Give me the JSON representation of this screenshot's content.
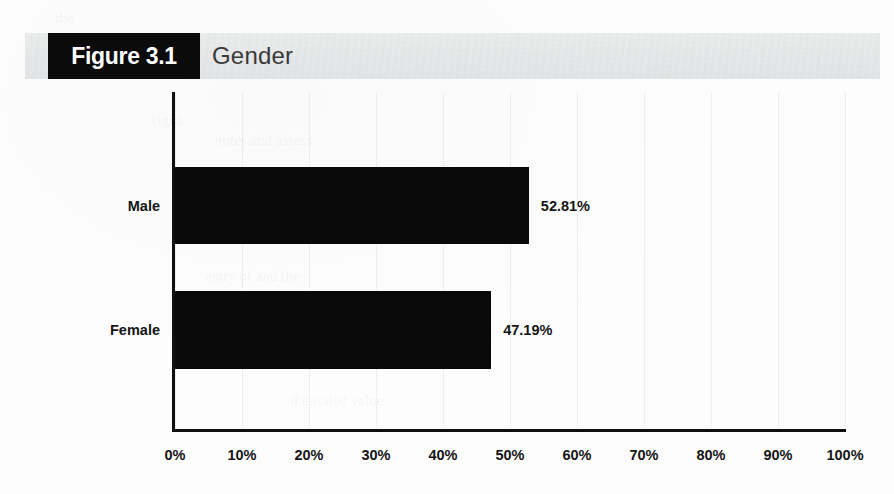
{
  "figure": {
    "number_label": "Figure 3.1",
    "title": "Gender"
  },
  "chart_data": {
    "type": "bar",
    "orientation": "horizontal",
    "title": "Gender",
    "categories": [
      "Male",
      "Female"
    ],
    "values": [
      52.81,
      47.19
    ],
    "value_labels": [
      "52.81%",
      "47.19%"
    ],
    "xlabel": "",
    "ylabel": "",
    "xlim": [
      0,
      100
    ],
    "x_tick_labels": [
      "0%",
      "10%",
      "20%",
      "30%",
      "40%",
      "50%",
      "60%",
      "70%",
      "80%",
      "90%",
      "100%"
    ],
    "x_tick_values": [
      0,
      10,
      20,
      30,
      40,
      50,
      60,
      70,
      80,
      90,
      100
    ],
    "grid": "vertical-dotted",
    "legend": "none",
    "bar_color": "#090909",
    "axis_color": "#101010",
    "header_band_color": "#e8e9ea",
    "figure_tag_background": "#0b0b0b",
    "figure_tag_text_color": "#ffffff"
  }
}
